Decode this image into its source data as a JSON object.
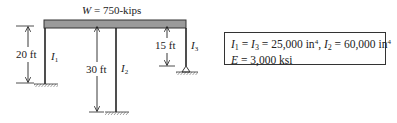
{
  "diagram": {
    "load_label": "W = 750-kips",
    "load_symbol": "W",
    "load_value": " = 750-kips",
    "columns": [
      {
        "id": "column-1",
        "label": "I",
        "subscript": "1",
        "height_label": "20 ft",
        "support": "fixed"
      },
      {
        "id": "column-2",
        "label": "I",
        "subscript": "2",
        "height_label": "30 ft",
        "support": "fixed"
      },
      {
        "id": "column-3",
        "label": "I",
        "subscript": "3",
        "height_label": "15 ft",
        "support": "pin"
      }
    ],
    "colors": {
      "beam_fill": "#9a9a9a",
      "line": "#222222"
    }
  },
  "properties": {
    "line1_text": "I1 = I3 = 25,000 in4, I2 = 60,000 in4",
    "line1": {
      "i1": "I",
      "i1_sub": "1",
      "eq1": " = ",
      "i3": "I",
      "i3_sub": "3",
      "eq2": " = 25,000 in",
      "exp1": "4",
      "comma": ", ",
      "i2": "I",
      "i2_sub": "2",
      "eq3": " = 60,000 in",
      "exp2": "4"
    },
    "line2": {
      "e": "E",
      "rest": " = 3,000 ksi"
    }
  }
}
